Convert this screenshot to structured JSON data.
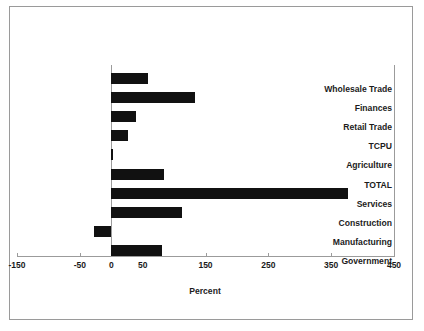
{
  "chart_data": {
    "type": "bar",
    "orientation": "horizontal",
    "title": "",
    "xlabel": "Percent",
    "ylabel": "",
    "xlim": [
      -150,
      450
    ],
    "xticks": [
      -150,
      -50,
      0,
      50,
      150,
      250,
      350,
      450
    ],
    "xtick_labels": [
      "-150",
      "-50",
      "0",
      "50",
      "150",
      "250",
      "350",
      "450"
    ],
    "grid": false,
    "legend": false,
    "bar_color": "#111111",
    "axis_color": "#9b9b9b",
    "categories": [
      "Wholesale Trade",
      "Finances",
      "Retail Trade",
      "TCPU",
      "Agriculture",
      "TOTAL",
      "Services",
      "Construction",
      "Manufacturing",
      "Government"
    ],
    "values": [
      58,
      133,
      40,
      27,
      2,
      84,
      377,
      113,
      -28,
      80
    ]
  }
}
